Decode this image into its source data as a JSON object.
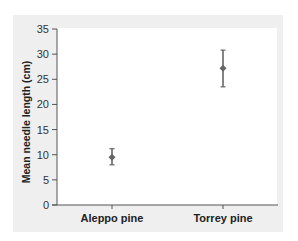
{
  "chart_data": {
    "type": "scatter",
    "subtype": "point-with-error-bars",
    "title": "",
    "xlabel": "",
    "ylabel": "Mean needle length (cm)",
    "ylim": [
      0,
      35
    ],
    "yticks": [
      0,
      5,
      10,
      15,
      20,
      25,
      30,
      35
    ],
    "categories": [
      "Aleppo pine",
      "Torrey pine"
    ],
    "series": [
      {
        "name": "Mean needle length",
        "values": [
          9.5,
          27.2
        ],
        "error_low": [
          8.0,
          23.5
        ],
        "error_high": [
          11.2,
          30.8
        ]
      }
    ],
    "grid": false,
    "legend": null,
    "colors": {
      "marker": "#666666",
      "axis": "#555555",
      "panel_bg": "#efefef",
      "plot_bg": "#ffffff"
    }
  }
}
